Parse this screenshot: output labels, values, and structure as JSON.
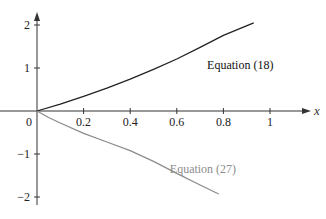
{
  "chart_data": {
    "type": "line",
    "title": "",
    "xlabel": "x",
    "ylabel": "",
    "xlim": [
      0,
      1.1
    ],
    "ylim": [
      -2.2,
      2.2
    ],
    "grid": false,
    "legend": "inline labels",
    "x_ticks": [
      "0",
      "0.2",
      "0.4",
      "0.6",
      "0.8",
      "1"
    ],
    "y_ticks": [
      "2",
      "1",
      "-1",
      "-2"
    ],
    "series": [
      {
        "name": "Equation (18)",
        "color": "#222222",
        "x": [
          0,
          0.1,
          0.2,
          0.3,
          0.4,
          0.5,
          0.6,
          0.7,
          0.8,
          0.93
        ],
        "y": [
          0,
          0.16,
          0.34,
          0.53,
          0.74,
          0.97,
          1.21,
          1.48,
          1.76,
          2.05
        ]
      },
      {
        "name": "Equation (27)",
        "color": "#8c8c8c",
        "x": [
          0,
          0.05,
          0.1,
          0.2,
          0.3,
          0.4,
          0.5,
          0.6,
          0.7,
          0.78
        ],
        "y": [
          0,
          -0.15,
          -0.28,
          -0.52,
          -0.72,
          -0.92,
          -1.17,
          -1.45,
          -1.72,
          -1.93
        ]
      }
    ],
    "annotations": [
      {
        "text": "Equation (18)",
        "x": 0.73,
        "y": 0.98,
        "color": "#111111"
      },
      {
        "text": "Equation (27)",
        "x": 0.57,
        "y": -1.44,
        "color": "#8c8c8c"
      }
    ]
  }
}
